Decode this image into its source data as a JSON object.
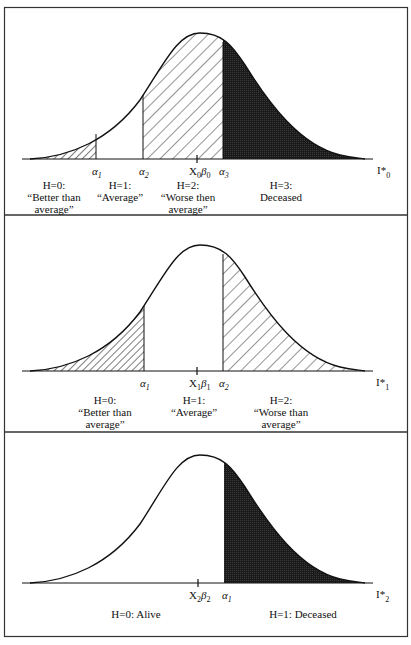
{
  "figure": {
    "panels": [
      {
        "id": "panel-0",
        "axis_label": "I*",
        "axis_sub": "0",
        "mean_label": "X",
        "mean_sub1": "0",
        "mean_beta": "β",
        "mean_sub2": "0",
        "thresholds": [
          {
            "symbol": "α",
            "sub": "1"
          },
          {
            "symbol": "α",
            "sub": "2"
          },
          {
            "symbol": "α",
            "sub": "3"
          }
        ],
        "categories": [
          {
            "line1": "H=0:",
            "line2": "“Better than",
            "line3": "average”",
            "fill": "dense-hatch"
          },
          {
            "line1": "H=1:",
            "line2": "“Average”",
            "line3": "",
            "fill": "none"
          },
          {
            "line1": "H=2:",
            "line2": "“Worse then",
            "line3": "average”",
            "fill": "sparse-hatch"
          },
          {
            "line1": "H=3:",
            "line2": "Deceased",
            "line3": "",
            "fill": "solid-dark"
          }
        ]
      },
      {
        "id": "panel-1",
        "axis_label": "I*",
        "axis_sub": "1",
        "mean_label": "X",
        "mean_sub1": "1",
        "mean_beta": "β",
        "mean_sub2": "1",
        "thresholds": [
          {
            "symbol": "α",
            "sub": "1"
          },
          {
            "symbol": "α",
            "sub": "2"
          }
        ],
        "categories": [
          {
            "line1": "H=0:",
            "line2": "“Better than",
            "line3": "average”",
            "fill": "dense-hatch"
          },
          {
            "line1": "H=1:",
            "line2": "“Average”",
            "line3": "",
            "fill": "none"
          },
          {
            "line1": "H=2:",
            "line2": "“Worse than",
            "line3": "average”",
            "fill": "sparse-hatch"
          }
        ]
      },
      {
        "id": "panel-2",
        "axis_label": "I*",
        "axis_sub": "2",
        "mean_label": "X",
        "mean_sub1": "2",
        "mean_beta": "β",
        "mean_sub2": "2",
        "thresholds": [
          {
            "symbol": "α",
            "sub": "1"
          }
        ],
        "categories": [
          {
            "line1": "H=0: Alive",
            "fill": "none"
          },
          {
            "line1": "H=1: Deceased",
            "fill": "solid-dark"
          }
        ]
      }
    ],
    "colors": {
      "ink": "#111111",
      "dark_fill": "#1a1a1a",
      "border": "#333333",
      "background": "#ffffff"
    }
  }
}
